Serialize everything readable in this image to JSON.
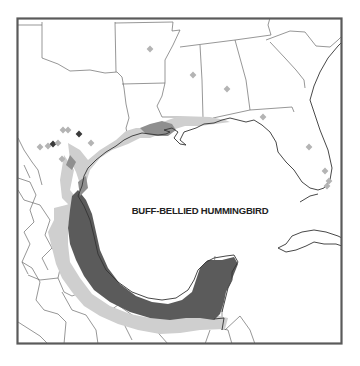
{
  "map": {
    "title": "BUFF-BELLIED HUMMINGBIRD",
    "region": "Gulf of Mexico",
    "legend_colors": {
      "year_round": "#5b5b5b",
      "nonbreeding": "#cfcfcf",
      "frame": "#5a5a5a",
      "background": "#ffffff"
    },
    "records": [
      {
        "shade": "light",
        "x": 150,
        "y": 49
      },
      {
        "shade": "light",
        "x": 193,
        "y": 75
      },
      {
        "shade": "light",
        "x": 227,
        "y": 89
      },
      {
        "shade": "light",
        "x": 263,
        "y": 117
      },
      {
        "shade": "light",
        "x": 309,
        "y": 147
      },
      {
        "shade": "light",
        "x": 325,
        "y": 171
      },
      {
        "shade": "light",
        "x": 63,
        "y": 130
      },
      {
        "shade": "light",
        "x": 68,
        "y": 130
      },
      {
        "shade": "light",
        "x": 91,
        "y": 143
      },
      {
        "shade": "light",
        "x": 62,
        "y": 159
      },
      {
        "shade": "light",
        "x": 40,
        "y": 147
      },
      {
        "shade": "light",
        "x": 48,
        "y": 146
      },
      {
        "shade": "dark",
        "x": 79,
        "y": 134
      },
      {
        "shade": "dark",
        "x": 53,
        "y": 144
      },
      {
        "shade": "light",
        "x": 58,
        "y": 143
      },
      {
        "shade": "light",
        "x": 329,
        "y": 181
      },
      {
        "shade": "light",
        "x": 327,
        "y": 186
      }
    ]
  }
}
